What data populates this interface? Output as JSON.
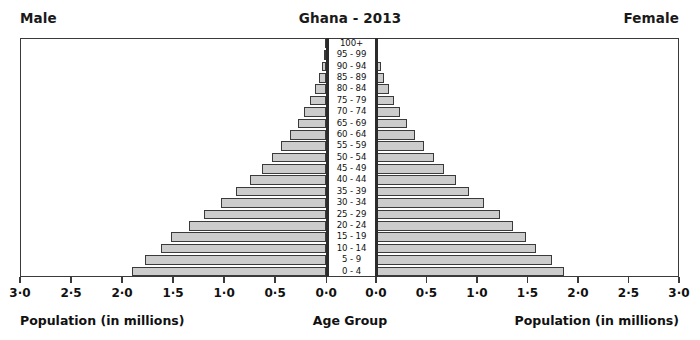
{
  "header": {
    "left_label": "Male",
    "right_label": "Female",
    "title": "Ghana - 2013"
  },
  "footer": {
    "left_axis_title": "Population (in millions)",
    "center_axis_title": "Age Group",
    "right_axis_title": "Population (in millions)"
  },
  "colors": {
    "bar_fill": "#cccccc",
    "bar_edge": "#3a3a3a",
    "frame": "#3a3a3a",
    "baseline": "#2b2b2b",
    "text": "#111111",
    "background": "#ffffff"
  },
  "chart_data": {
    "type": "bar",
    "chart_subtype": "population-pyramid",
    "title": "Ghana - 2013",
    "xlabel": "Population (in millions)",
    "ylabel": "Age Group",
    "grid": false,
    "legend": false,
    "xlim": [
      0,
      3.0
    ],
    "xticks": [
      0.0,
      0.5,
      1.0,
      1.5,
      2.0,
      2.5,
      3.0
    ],
    "xticklabels_left": [
      "3·0",
      "2·5",
      "2·0",
      "1·5",
      "1·0",
      "0·5",
      "0·0"
    ],
    "xticklabels_right": [
      "0·0",
      "0·5",
      "1·0",
      "1·5",
      "2·0",
      "2·5",
      "3·0"
    ],
    "categories": [
      "100+",
      "95 - 99",
      "90 - 94",
      "85 - 89",
      "80 - 84",
      "75 - 79",
      "70 - 74",
      "65 - 69",
      "60 - 64",
      "55 - 59",
      "50 - 54",
      "45 - 49",
      "40 - 44",
      "35 - 39",
      "30 - 34",
      "25 - 29",
      "20 - 24",
      "15 - 19",
      "10 - 14",
      "5 - 9",
      "0 - 4"
    ],
    "series": [
      {
        "name": "Male",
        "side": "left",
        "units": "millions",
        "values": [
          0.01,
          0.02,
          0.04,
          0.07,
          0.11,
          0.16,
          0.22,
          0.28,
          0.35,
          0.44,
          0.53,
          0.63,
          0.75,
          0.88,
          1.03,
          1.2,
          1.34,
          1.52,
          1.62,
          1.78,
          1.9
        ]
      },
      {
        "name": "Female",
        "side": "right",
        "units": "millions",
        "values": [
          0.01,
          0.02,
          0.05,
          0.08,
          0.13,
          0.18,
          0.24,
          0.31,
          0.39,
          0.48,
          0.57,
          0.67,
          0.79,
          0.92,
          1.07,
          1.23,
          1.36,
          1.49,
          1.58,
          1.74,
          1.86
        ]
      }
    ]
  }
}
